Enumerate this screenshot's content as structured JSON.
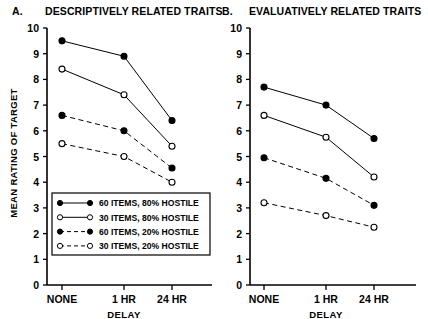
{
  "figure": {
    "background": "#ffffff",
    "ink": "#000000"
  },
  "panels": [
    {
      "id": "panel-a",
      "letter": "A.",
      "title": "DESCRIPTIVELY RELATED TRAITS",
      "ylabel": "MEAN RATING OF TARGET",
      "xlabel": "DELAY",
      "show_ylabel": true,
      "show_legend": true
    },
    {
      "id": "panel-b",
      "letter": "B.",
      "title": "EVALUATIVELY RELATED TRAITS",
      "ylabel": "",
      "xlabel": "DELAY",
      "show_ylabel": false,
      "show_legend": false
    }
  ],
  "axes": {
    "y_ticks": [
      "10",
      "9",
      "8",
      "7",
      "6",
      "5",
      "4",
      "3",
      "2",
      "1",
      "0"
    ],
    "y_min": 0,
    "y_max": 10,
    "x_ticks": [
      "NONE",
      "1 HR",
      "24 HR"
    ],
    "xlabel": "DELAY",
    "ylabel": "MEAN RATING OF TARGET"
  },
  "legend": {
    "entries": [
      {
        "label": "60 ITEMS, 80% HOSTILE",
        "marker": "filled-circle",
        "line": "solid"
      },
      {
        "label": "30 ITEMS, 80% HOSTILE",
        "marker": "open-circle",
        "line": "solid"
      },
      {
        "label": "60 ITEMS, 20% HOSTILE",
        "marker": "filled-circle",
        "line": "dashed"
      },
      {
        "label": "30 ITEMS, 20% HOSTILE",
        "marker": "open-circle",
        "line": "dashed"
      }
    ]
  },
  "chart_data": [
    {
      "type": "line",
      "panel": "A",
      "title": "DESCRIPTIVELY RELATED TRAITS",
      "xlabel": "DELAY",
      "ylabel": "MEAN RATING OF TARGET",
      "categories": [
        "NONE",
        "1 HR",
        "24 HR"
      ],
      "ylim": [
        0,
        10
      ],
      "yticks": [
        0,
        1,
        2,
        3,
        4,
        5,
        6,
        7,
        8,
        9,
        10
      ],
      "grid": false,
      "legend_position": "inside-lower-left",
      "series": [
        {
          "name": "60 ITEMS, 80% HOSTILE",
          "marker": "filled-circle",
          "line": "solid",
          "values": [
            9.5,
            8.9,
            6.4
          ]
        },
        {
          "name": "30 ITEMS, 80% HOSTILE",
          "marker": "open-circle",
          "line": "solid",
          "values": [
            8.4,
            7.4,
            5.4
          ]
        },
        {
          "name": "60 ITEMS, 20% HOSTILE",
          "marker": "filled-circle",
          "line": "dashed",
          "values": [
            6.6,
            6.0,
            4.55
          ]
        },
        {
          "name": "30 ITEMS, 20% HOSTILE",
          "marker": "open-circle",
          "line": "dashed",
          "values": [
            5.5,
            5.0,
            4.0
          ]
        }
      ]
    },
    {
      "type": "line",
      "panel": "B",
      "title": "EVALUATIVELY RELATED TRAITS",
      "xlabel": "DELAY",
      "ylabel": "",
      "categories": [
        "NONE",
        "1 HR",
        "24 HR"
      ],
      "ylim": [
        0,
        10
      ],
      "yticks": [
        0,
        1,
        2,
        3,
        4,
        5,
        6,
        7,
        8,
        9,
        10
      ],
      "grid": false,
      "legend_position": "none",
      "series": [
        {
          "name": "60 ITEMS, 80% HOSTILE",
          "marker": "filled-circle",
          "line": "solid",
          "values": [
            7.7,
            7.0,
            5.7
          ]
        },
        {
          "name": "30 ITEMS, 80% HOSTILE",
          "marker": "open-circle",
          "line": "solid",
          "values": [
            6.6,
            5.75,
            4.2
          ]
        },
        {
          "name": "60 ITEMS, 20% HOSTILE",
          "marker": "filled-circle",
          "line": "dashed",
          "values": [
            4.95,
            4.15,
            3.1
          ]
        },
        {
          "name": "30 ITEMS, 20% HOSTILE",
          "marker": "open-circle",
          "line": "dashed",
          "values": [
            3.2,
            2.7,
            2.25
          ]
        }
      ]
    }
  ]
}
